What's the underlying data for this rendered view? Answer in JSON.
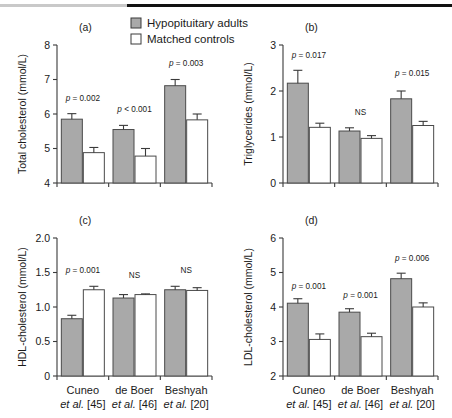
{
  "figure": {
    "legend": {
      "items": [
        {
          "label": "Hypopituitary adults",
          "swatch": "filled",
          "color": "#a9a9a9"
        },
        {
          "label": "Matched controls",
          "swatch": "open",
          "color": "#ffffff"
        }
      ]
    },
    "categories": [
      {
        "line1": "Cuneo",
        "line2_italic": "et al.",
        "line2_rest": " [45]"
      },
      {
        "line1": "de Boer",
        "line2_italic": "et al.",
        "line2_rest": " [46]"
      },
      {
        "line1": "Beshyah",
        "line2_italic": "et al.",
        "line2_rest": " [20]"
      }
    ],
    "series_names": [
      "Hypopituitary adults",
      "Matched controls"
    ]
  },
  "chart_data": [
    {
      "type": "bar",
      "panel": "(a)",
      "title": "",
      "xlabel": "",
      "ylabel": "Total cholesterol (mmol/L)",
      "ylim": [
        4,
        8
      ],
      "yticks": [
        4,
        5,
        6,
        7,
        8
      ],
      "ytick_labels": [
        "4",
        "5",
        "6",
        "7",
        "8"
      ],
      "grid": false,
      "categories": [
        "Cuneo et al. [45]",
        "de Boer et al. [46]",
        "Beshyah et al. [20]"
      ],
      "series": [
        {
          "name": "Hypopituitary adults",
          "values": [
            5.85,
            5.55,
            6.82
          ],
          "errors": [
            0.16,
            0.12,
            0.18
          ]
        },
        {
          "name": "Matched controls",
          "values": [
            4.88,
            4.78,
            5.83
          ],
          "errors": [
            0.15,
            0.22,
            0.17
          ]
        }
      ],
      "annotations": [
        {
          "group": 0,
          "text_italic": "p",
          "text_rest": " = 0.002",
          "y": 6.38
        },
        {
          "group": 1,
          "text_italic": "p",
          "text_rest": " < 0.001",
          "y": 6.05
        },
        {
          "group": 2,
          "text_italic": "p",
          "text_rest": " = 0.003",
          "y": 7.38
        }
      ]
    },
    {
      "type": "bar",
      "panel": "(b)",
      "title": "",
      "xlabel": "",
      "ylabel": "Triglycerides (mmol/L)",
      "ylim": [
        0,
        3
      ],
      "yticks": [
        0,
        1,
        2,
        3
      ],
      "ytick_labels": [
        "0",
        "1",
        "2",
        "3"
      ],
      "grid": false,
      "categories": [
        "Cuneo et al. [45]",
        "de Boer et al. [46]",
        "Beshyah et al. [20]"
      ],
      "series": [
        {
          "name": "Hypopituitary adults",
          "values": [
            2.17,
            1.13,
            1.83
          ],
          "errors": [
            0.28,
            0.07,
            0.17
          ]
        },
        {
          "name": "Matched controls",
          "values": [
            1.21,
            0.97,
            1.25,
            0
          ],
          "errors": [
            0.09,
            0.06,
            0.09
          ]
        }
      ],
      "annotations": [
        {
          "group": 0,
          "text_italic": "p",
          "text_rest": " = 0.017",
          "y": 2.72
        },
        {
          "group": 1,
          "text_italic": "",
          "text_rest": "NS",
          "y": 1.48
        },
        {
          "group": 2,
          "text_italic": "p",
          "text_rest": " = 0.015",
          "y": 2.32
        }
      ]
    },
    {
      "type": "bar",
      "panel": "(c)",
      "title": "",
      "xlabel": "",
      "ylabel": "HDL-cholesterol (mmol/L)",
      "ylim": [
        0,
        2.0
      ],
      "yticks": [
        0,
        0.5,
        1.0,
        1.5,
        2.0
      ],
      "ytick_labels": [
        "0",
        "0.5",
        "1.0",
        "1.5",
        "2.0"
      ],
      "grid": false,
      "categories": [
        "Cuneo et al. [45]",
        "de Boer et al. [46]",
        "Beshyah et al. [20]"
      ],
      "series": [
        {
          "name": "Hypopituitary adults",
          "values": [
            0.83,
            1.13,
            1.25
          ],
          "errors": [
            0.05,
            0.05,
            0.05
          ]
        },
        {
          "name": "Matched controls",
          "values": [
            1.25,
            1.18,
            1.24
          ],
          "errors": [
            0.05,
            0.01,
            0.04
          ]
        }
      ],
      "annotations": [
        {
          "group": 0,
          "text_italic": "p",
          "text_rest": " = 0.001",
          "y": 1.5
        },
        {
          "group": 1,
          "text_italic": "",
          "text_rest": "NS",
          "y": 1.42
        },
        {
          "group": 2,
          "text_italic": "",
          "text_rest": "NS",
          "y": 1.5
        }
      ]
    },
    {
      "type": "bar",
      "panel": "(d)",
      "title": "",
      "xlabel": "",
      "ylabel": "LDL-cholesterol (mmol/L)",
      "ylim": [
        2,
        6
      ],
      "yticks": [
        2,
        3,
        4,
        5,
        6
      ],
      "ytick_labels": [
        "2",
        "3",
        "4",
        "5",
        "6"
      ],
      "grid": false,
      "categories": [
        "Cuneo et al. [45]",
        "de Boer et al. [46]",
        "Beshyah et al. [20]"
      ],
      "series": [
        {
          "name": "Hypopituitary adults",
          "values": [
            4.11,
            3.85,
            4.82
          ],
          "errors": [
            0.13,
            0.1,
            0.16
          ]
        },
        {
          "name": "Matched controls",
          "values": [
            3.06,
            3.14,
            4.0
          ],
          "errors": [
            0.16,
            0.1,
            0.12
          ]
        }
      ],
      "annotations": [
        {
          "group": 0,
          "text_italic": "p",
          "text_rest": " = 0.001",
          "y": 4.52
        },
        {
          "group": 1,
          "text_italic": "p",
          "text_rest": " = 0.001",
          "y": 4.27
        },
        {
          "group": 2,
          "text_italic": "p",
          "text_rest": " = 0.006",
          "y": 5.33
        }
      ]
    }
  ]
}
